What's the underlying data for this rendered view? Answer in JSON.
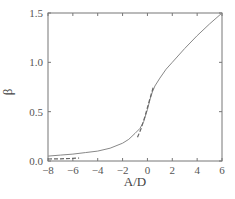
{
  "chart_data": {
    "type": "line",
    "title": "",
    "xlabel": "A/D",
    "ylabel": "β",
    "xlim": [
      -8,
      6
    ],
    "ylim": [
      0,
      1.5
    ],
    "x_ticks": [
      -8,
      -6,
      -4,
      -2,
      0,
      2,
      4,
      6
    ],
    "x_tick_labels": [
      "-8",
      "-6",
      "-4",
      "-2",
      "0",
      "2",
      "4",
      "6"
    ],
    "y_ticks": [
      0.0,
      0.5,
      1.0,
      1.5
    ],
    "y_tick_labels": [
      "0.0",
      "0.5",
      "1.0",
      "1.5"
    ],
    "grid": false,
    "legend": null,
    "series": [
      {
        "name": "exact",
        "style": "solid",
        "color": "#888888",
        "x": [
          -8,
          -7,
          -6,
          -5,
          -4,
          -3,
          -2,
          -1.5,
          -1,
          -0.6,
          -0.3,
          0,
          0.2,
          0.4,
          0.6,
          1,
          1.5,
          2,
          3,
          4,
          5,
          6
        ],
        "y": [
          0.05,
          0.06,
          0.07,
          0.085,
          0.1,
          0.13,
          0.18,
          0.22,
          0.28,
          0.33,
          0.4,
          0.52,
          0.62,
          0.7,
          0.76,
          0.84,
          0.93,
          1.0,
          1.14,
          1.27,
          1.39,
          1.5
        ]
      },
      {
        "name": "asymptote-low",
        "style": "dashed",
        "color": "#666666",
        "x": [
          -8,
          -7,
          -6,
          -5.5
        ],
        "y": [
          0.02,
          0.022,
          0.026,
          0.03
        ]
      },
      {
        "name": "asymptote-center",
        "style": "dashed",
        "color": "#666666",
        "x": [
          -0.8,
          -0.5,
          -0.2,
          0,
          0.2,
          0.5
        ],
        "y": [
          0.24,
          0.33,
          0.45,
          0.54,
          0.63,
          0.76
        ]
      }
    ]
  }
}
